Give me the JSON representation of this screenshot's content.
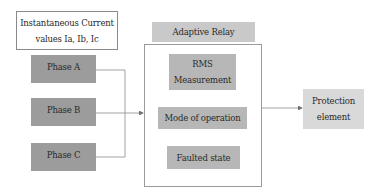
{
  "input_box": {
    "line1": "Instantaneous Current",
    "line2": "values Ia, Ib, Ic"
  },
  "phases": [
    {
      "label": "Phase A"
    },
    {
      "label": "Phase B"
    },
    {
      "label": "Phase C"
    }
  ],
  "relay": {
    "title": "Adaptive Relay",
    "steps": [
      {
        "line1": "RMS",
        "line2": "Measurement"
      },
      {
        "line1": "Mode of operation"
      },
      {
        "line1": "Faulted state"
      }
    ]
  },
  "output": {
    "line1": "Protection",
    "line2": "element"
  },
  "colors": {
    "phase_fill": "#9c9c9c",
    "step_fill": "#b7b7b7",
    "relay_label_fill": "#c9c9c9",
    "output_fill": "#d9d9d9",
    "line": "#8c8c8c"
  }
}
